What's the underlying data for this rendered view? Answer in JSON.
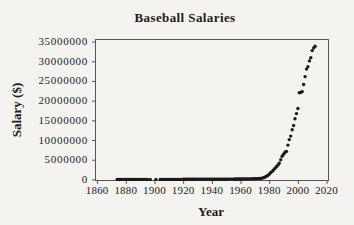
{
  "figure": {
    "background": "#f4f3f0"
  },
  "colors": {
    "marker": "#1a1a1a",
    "frame": "#555555",
    "text": "#1c1c1c"
  },
  "chart_data": {
    "type": "scatter",
    "title": "Baseball Salaries",
    "xlabel": "Year",
    "ylabel": "Salary ($)",
    "xlim": [
      1858.5,
      2021
    ],
    "ylim": [
      -150000,
      35650000
    ],
    "grid": false,
    "legend": null,
    "x_ticks": [
      1860,
      1880,
      1900,
      1920,
      1940,
      1960,
      1980,
      2000,
      2020
    ],
    "x_tick_labels": [
      "1860",
      "1880",
      "1900",
      "1920",
      "1940",
      "1960",
      "1980",
      "2000",
      "2020"
    ],
    "y_ticks": [
      0,
      5000000,
      10000000,
      15000000,
      20000000,
      25000000,
      30000000,
      35000000
    ],
    "y_tick_labels": [
      "0",
      "5000000",
      "10000000",
      "15000000",
      "20000000",
      "25000000",
      "30000000",
      "35000000"
    ],
    "marker": {
      "shape": "circle",
      "radius": 1.7,
      "color": "#1a1a1a"
    },
    "points": [
      [
        1874,
        1800
      ],
      [
        1875,
        2000
      ],
      [
        1876,
        2500
      ],
      [
        1877,
        2600
      ],
      [
        1878,
        2800
      ],
      [
        1879,
        3000
      ],
      [
        1880,
        3100
      ],
      [
        1881,
        3200
      ],
      [
        1882,
        3100
      ],
      [
        1883,
        3300
      ],
      [
        1884,
        3400
      ],
      [
        1885,
        3500
      ],
      [
        1886,
        3800
      ],
      [
        1887,
        4000
      ],
      [
        1888,
        4200
      ],
      [
        1889,
        4500
      ],
      [
        1890,
        4800
      ],
      [
        1891,
        4500
      ],
      [
        1892,
        4000
      ],
      [
        1893,
        4200
      ],
      [
        1894,
        4500
      ],
      [
        1895,
        4700
      ],
      [
        1897,
        4800
      ],
      [
        1901,
        5000
      ],
      [
        1904,
        5500
      ],
      [
        1905,
        5800
      ],
      [
        1906,
        6000
      ],
      [
        1907,
        6200
      ],
      [
        1908,
        6500
      ],
      [
        1909,
        6800
      ],
      [
        1910,
        7500
      ],
      [
        1911,
        8000
      ],
      [
        1912,
        9000
      ],
      [
        1913,
        10000
      ],
      [
        1914,
        11000
      ],
      [
        1915,
        12000
      ],
      [
        1916,
        12000
      ],
      [
        1917,
        12500
      ],
      [
        1918,
        13000
      ],
      [
        1919,
        14000
      ],
      [
        1920,
        20000
      ],
      [
        1921,
        25000
      ],
      [
        1922,
        30000
      ],
      [
        1923,
        32000
      ],
      [
        1924,
        35000
      ],
      [
        1925,
        40000
      ],
      [
        1926,
        45000
      ],
      [
        1927,
        52000
      ],
      [
        1928,
        60000
      ],
      [
        1929,
        65000
      ],
      [
        1930,
        80000
      ],
      [
        1931,
        80000
      ],
      [
        1932,
        75000
      ],
      [
        1933,
        60000
      ],
      [
        1934,
        55000
      ],
      [
        1935,
        50000
      ],
      [
        1936,
        48000
      ],
      [
        1937,
        46000
      ],
      [
        1938,
        45000
      ],
      [
        1939,
        44000
      ],
      [
        1940,
        43000
      ],
      [
        1941,
        42000
      ],
      [
        1942,
        43500
      ],
      [
        1943,
        45000
      ],
      [
        1944,
        46000
      ],
      [
        1945,
        48000
      ],
      [
        1946,
        50000
      ],
      [
        1947,
        55000
      ],
      [
        1948,
        60000
      ],
      [
        1949,
        65000
      ],
      [
        1950,
        70000
      ],
      [
        1951,
        75000
      ],
      [
        1952,
        80000
      ],
      [
        1953,
        85000
      ],
      [
        1954,
        88000
      ],
      [
        1955,
        90000
      ],
      [
        1956,
        92000
      ],
      [
        1957,
        95000
      ],
      [
        1958,
        98000
      ],
      [
        1959,
        100000
      ],
      [
        1960,
        105000
      ],
      [
        1961,
        110000
      ],
      [
        1962,
        115000
      ],
      [
        1963,
        120000
      ],
      [
        1964,
        125000
      ],
      [
        1965,
        130000
      ],
      [
        1966,
        135000
      ],
      [
        1967,
        140000
      ],
      [
        1968,
        148000
      ],
      [
        1969,
        155000
      ],
      [
        1970,
        165000
      ],
      [
        1971,
        180000
      ],
      [
        1972,
        200000
      ],
      [
        1973,
        225000
      ],
      [
        1974,
        250000
      ],
      [
        1975,
        280000
      ],
      [
        1976,
        450000
      ],
      [
        1977,
        560000
      ],
      [
        1978,
        800000
      ],
      [
        1979,
        1000000
      ],
      [
        1980,
        1300000
      ],
      [
        1981,
        1700000
      ],
      [
        1982,
        2000000
      ],
      [
        1983,
        2400000
      ],
      [
        1984,
        2800000
      ],
      [
        1985,
        3200000
      ],
      [
        1986,
        3600000
      ],
      [
        1987,
        4100000
      ],
      [
        1988,
        5000000
      ],
      [
        1989,
        5900000
      ],
      [
        1990,
        6400000
      ],
      [
        1991,
        6900000
      ],
      [
        1992,
        7100000
      ],
      [
        1993,
        8700000
      ],
      [
        1994,
        10100000
      ],
      [
        1995,
        11000000
      ],
      [
        1996,
        12600000
      ],
      [
        1997,
        13700000
      ],
      [
        1998,
        15400000
      ],
      [
        1999,
        16700000
      ],
      [
        2000,
        18000000
      ],
      [
        2001,
        22000000
      ],
      [
        2002,
        22100000
      ],
      [
        2003,
        22300000
      ],
      [
        2004,
        24100000
      ],
      [
        2005,
        26100000
      ],
      [
        2006,
        28000000
      ],
      [
        2007,
        28600000
      ],
      [
        2008,
        30100000
      ],
      [
        2009,
        30900000
      ],
      [
        2010,
        32700000
      ],
      [
        2011,
        33400000
      ],
      [
        2012,
        33800000
      ]
    ]
  }
}
